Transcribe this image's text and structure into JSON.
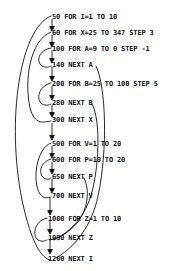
{
  "diagram": {
    "ink_color": "#111111",
    "background": "#ffffff",
    "lines": [
      {
        "number": "50",
        "statement": "FOR I=1 TO 10",
        "x": 52,
        "y": 17,
        "kind": "for"
      },
      {
        "number": "60",
        "statement": "FOR X=25 TO 347 STEP 3",
        "x": 52,
        "y": 33,
        "kind": "for"
      },
      {
        "number": "100",
        "statement": "FOR A=9 TO 0 STEP -1",
        "x": 52,
        "y": 49,
        "kind": "for"
      },
      {
        "number": "140",
        "statement": "NEXT A",
        "x": 52,
        "y": 65,
        "kind": "next"
      },
      {
        "number": "200",
        "statement": "FOR B=25 TO 100 STEP 5",
        "x": 52,
        "y": 84,
        "kind": "for"
      },
      {
        "number": "280",
        "statement": "NEXT B",
        "x": 52,
        "y": 103,
        "kind": "next"
      },
      {
        "number": "300",
        "statement": "NEXT X",
        "x": 52,
        "y": 120,
        "kind": "next"
      },
      {
        "number": "500",
        "statement": "FOR V=1 TO 20",
        "x": 52,
        "y": 144,
        "kind": "for"
      },
      {
        "number": "600",
        "statement": "FOR P=10 TO 20",
        "x": 52,
        "y": 160,
        "kind": "for"
      },
      {
        "number": "650",
        "statement": "NEXT P",
        "x": 52,
        "y": 177,
        "kind": "next"
      },
      {
        "number": "700",
        "statement": "NEXT V",
        "x": 52,
        "y": 196,
        "kind": "next"
      },
      {
        "number": "1000",
        "statement": "FOR Z=1 TO 10",
        "x": 48,
        "y": 219,
        "kind": "for"
      },
      {
        "number": "1090",
        "statement": "NEXT Z",
        "x": 48,
        "y": 238,
        "kind": "next"
      },
      {
        "number": "1200",
        "statement": "NEXT I",
        "x": 48,
        "y": 259,
        "kind": "next"
      }
    ],
    "loop_pairs": [
      {
        "variable": "I",
        "for_line": "50",
        "next_line": "1200"
      },
      {
        "variable": "X",
        "for_line": "60",
        "next_line": "300"
      },
      {
        "variable": "A",
        "for_line": "100",
        "next_line": "140"
      },
      {
        "variable": "B",
        "for_line": "200",
        "next_line": "280"
      },
      {
        "variable": "V",
        "for_line": "500",
        "next_line": "700"
      },
      {
        "variable": "P",
        "for_line": "600",
        "next_line": "650"
      },
      {
        "variable": "Z",
        "for_line": "1000",
        "next_line": "1090"
      }
    ]
  }
}
